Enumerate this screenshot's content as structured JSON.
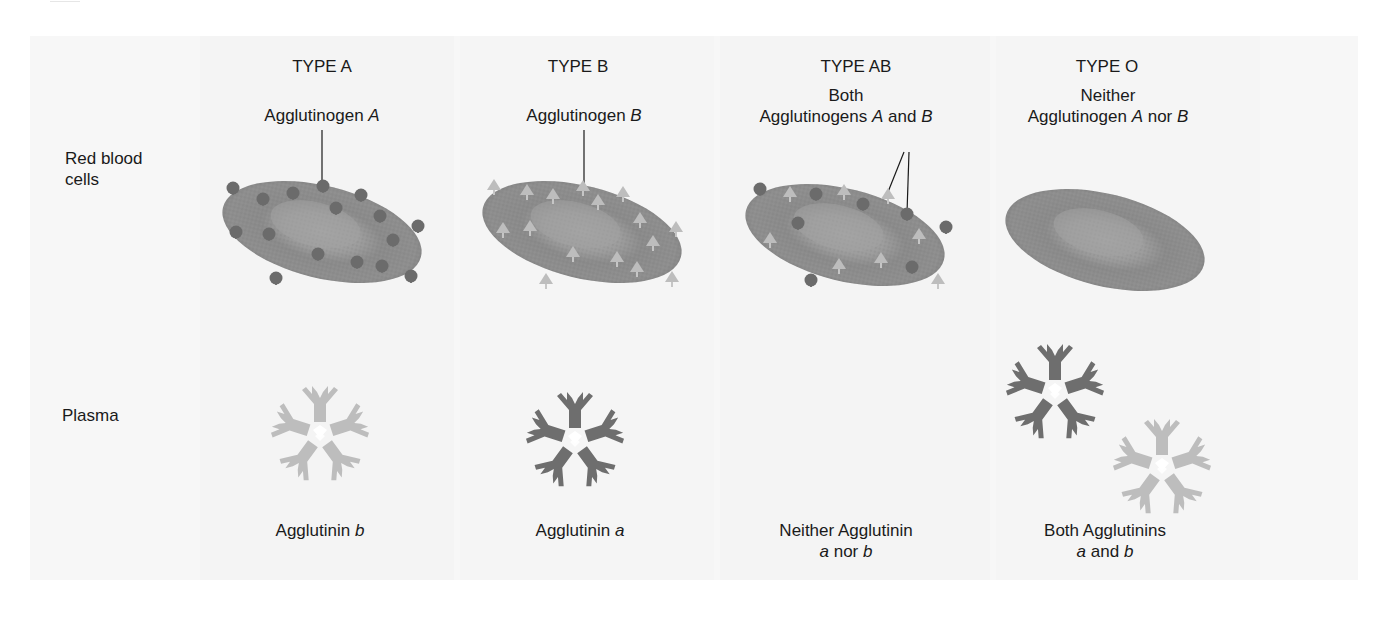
{
  "row_labels": {
    "rbc_line1": "Red blood",
    "rbc_line2": "cells",
    "plasma": "Plasma"
  },
  "columns": [
    {
      "type_label": "TYPE A",
      "agglutinogen": {
        "line1": "",
        "pre": "Agglutinogen ",
        "a": "A",
        "mid": "",
        "b": "",
        "post": ""
      },
      "agglutinin": {
        "line1_pre": "Agglutinin ",
        "line1_ital": "b",
        "line2": ""
      }
    },
    {
      "type_label": "TYPE B",
      "agglutinogen": {
        "line1": "",
        "pre": "Agglutinogen ",
        "a": "B",
        "mid": "",
        "b": "",
        "post": ""
      },
      "agglutinin": {
        "line1_pre": "Agglutinin ",
        "line1_ital": "a",
        "line2": ""
      }
    },
    {
      "type_label": "TYPE AB",
      "agglutinogen": {
        "line1": "Both",
        "pre": "Agglutinogens ",
        "a": "A",
        "mid": " and ",
        "b": "B",
        "post": ""
      },
      "agglutinin": {
        "line1_pre": "Neither Agglutinin",
        "line1_ital": "",
        "line2_a": "a",
        "line2_mid": " nor ",
        "line2_b": "b"
      }
    },
    {
      "type_label": "TYPE O",
      "agglutinogen": {
        "line1": "Neither",
        "pre": "Agglutinogen  ",
        "a": "A",
        "mid": " nor ",
        "b": "B",
        "post": ""
      },
      "agglutinin": {
        "line1_pre": "Both Agglutinins",
        "line1_ital": "",
        "line2_a": "a",
        "line2_mid": " and ",
        "line2_b": "b"
      }
    }
  ],
  "colors": {
    "panel_bg": "#f7f7f7",
    "cell_body": "#8f8f8f",
    "cell_center": "#a3a3a3",
    "cell_rim": "#7a7a7a",
    "antigen_a": "#6b6b6b",
    "antigen_b": "#bcbcbc",
    "agglutinin_a": "#6e6e6e",
    "agglutinin_b": "#bdbdbd",
    "text": "#1a1a1a"
  }
}
